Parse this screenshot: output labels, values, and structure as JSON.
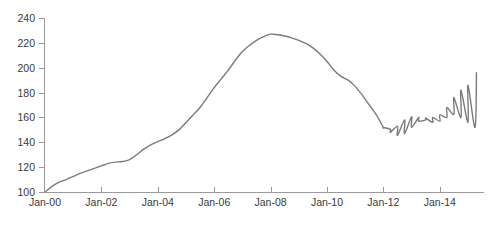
{
  "chart_data": {
    "type": "line",
    "title": "",
    "subtitle": "",
    "xlabel": "",
    "ylabel": "",
    "xlim": [
      "Jan-00",
      "Jan-15"
    ],
    "ylim": [
      90,
      245
    ],
    "y_axis_start": 100,
    "grid": false,
    "legend": false,
    "legend_position": "none",
    "line_color": "#7a7a7a",
    "axis_color": "#9a9a9a",
    "background_color": "#ffffff",
    "y_ticks": [
      100,
      120,
      140,
      160,
      180,
      200,
      220,
      240
    ],
    "y_tick_labels": [
      "100",
      "120",
      "140",
      "160",
      "180",
      "200",
      "220",
      "240"
    ],
    "x_ticks": [
      "Jan-00",
      "Jan-02",
      "Jan-04",
      "Jan-06",
      "Jan-08",
      "Jan-10",
      "Jan-12",
      "Jan-14"
    ],
    "x_tick_labels": [
      "Jan-00",
      "Jan-02",
      "Jan-04",
      "Jan-06",
      "Jan-08",
      "Jan-10",
      "Jan-12",
      "Jan-14"
    ],
    "x_tick_values": [
      0,
      2,
      4,
      6,
      8,
      10,
      12,
      14
    ],
    "x_range": [
      0,
      15.3
    ],
    "series": [
      {
        "name": "Index",
        "color": "#7a7a7a",
        "x": [
          0.0,
          0.25,
          0.5,
          0.75,
          1.0,
          1.25,
          1.5,
          1.75,
          2.0,
          2.25,
          2.5,
          2.75,
          3.0,
          3.25,
          3.5,
          3.75,
          4.0,
          4.25,
          4.5,
          4.75,
          5.0,
          5.25,
          5.5,
          5.75,
          6.0,
          6.25,
          6.5,
          6.75,
          7.0,
          7.25,
          7.5,
          7.75,
          8.0,
          8.25,
          8.5,
          8.75,
          9.0,
          9.25,
          9.5,
          9.75,
          10.0,
          10.25,
          10.5,
          10.75,
          11.0,
          11.25,
          11.5,
          11.75,
          12.0,
          12.25,
          12.5,
          12.75,
          13.0,
          13.25,
          13.5,
          13.75,
          14.0,
          14.25,
          14.5,
          14.75,
          15.0,
          15.25
        ],
        "values": [
          100.0,
          104.5,
          108.0,
          110.0,
          112.5,
          115.0,
          117.0,
          119.0,
          121.0,
          123.0,
          124.0,
          124.5,
          126.0,
          130.0,
          134.5,
          138.0,
          140.5,
          143.0,
          146.0,
          150.0,
          156.0,
          162.0,
          168.0,
          176.0,
          184.0,
          191.0,
          198.0,
          206.0,
          213.0,
          218.0,
          222.0,
          225.0,
          227.0,
          226.5,
          225.5,
          224.0,
          222.0,
          219.5,
          216.0,
          211.0,
          205.0,
          198.0,
          193.0,
          190.0,
          185.0,
          178.0,
          170.0,
          162.0,
          152.0,
          150.5,
          153.0,
          158.0,
          160.5,
          160.0,
          158.0,
          156.0,
          157.0,
          160.0,
          162.5,
          160.0,
          156.0,
          152.0
        ]
      },
      {
        "name": "Index (continued)",
        "color": "#7a7a7a",
        "x": [
          12.0,
          12.25,
          12.5,
          12.75,
          13.0,
          13.25,
          13.5,
          13.75,
          14.0,
          14.25,
          14.5,
          14.75,
          15.0,
          15.3
        ],
        "values": [
          152.0,
          148.0,
          145.5,
          147.0,
          152.0,
          157.0,
          159.5,
          160.0,
          162.0,
          168.0,
          176.0,
          182.0,
          186.0,
          196.0
        ]
      }
    ],
    "data_points": {
      "start_value": 100,
      "start_date": "Jan-00",
      "peak_value": 227,
      "peak_date": "Jan-06",
      "trough_value": 145.5,
      "trough_date": "Jul-12",
      "end_value": 196,
      "end_date": "Apr-15"
    }
  }
}
